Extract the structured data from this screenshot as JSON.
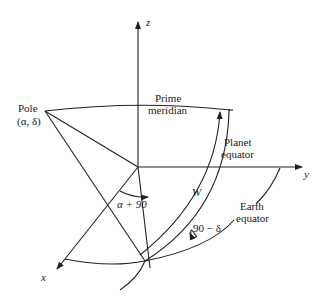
{
  "figure": {
    "axes": {
      "x": "x",
      "y": "y",
      "z": "z"
    },
    "labels": {
      "pole_line1": "Pole",
      "pole_line2": "(α, δ)",
      "prime_line1": "Prime",
      "prime_line2": "meridian",
      "planet_line1": "Planet",
      "planet_line2": "equator",
      "earth_line1": "Earth",
      "earth_line2": "equator",
      "angle_alpha": "α + 90",
      "angle_w": "W",
      "angle_delta": "90 − δ"
    },
    "colors": {
      "line": "#222222",
      "background": "#ffffff"
    }
  }
}
